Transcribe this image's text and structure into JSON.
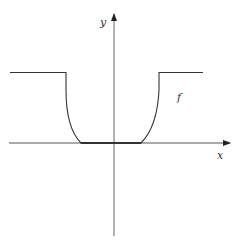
{
  "diagram": {
    "type": "function-graph",
    "axes": {
      "x_label": "x",
      "y_label": "y",
      "color": "#555555"
    },
    "curve": {
      "label": "f",
      "color": "#333333",
      "description": "Flat high plateau on both sides, dropping via steep smooth curves to zero in a flat region around the origin"
    }
  }
}
